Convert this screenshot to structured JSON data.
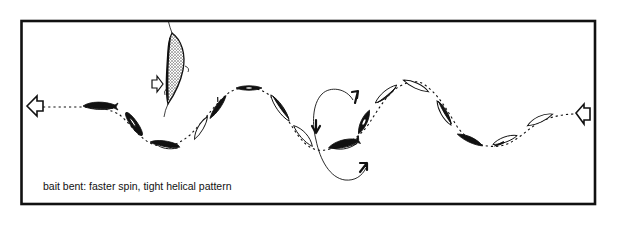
{
  "figure": {
    "caption": "bait bent: faster spin, tight helical pattern",
    "frame_color": "#111111",
    "background": "#ffffff"
  },
  "elements": {
    "hooked_bait": "bent bait fish on hook (stippled)",
    "direction_arrows": [
      "left pull arrow",
      "right water-flow arrow",
      "small arrow pointing at bait"
    ],
    "loop_arrows": [
      "rotation arrow top",
      "rotation arrow middle",
      "rotation arrow bottom"
    ],
    "path": "dotted sinusoidal helical path with spinning bait silhouettes"
  }
}
